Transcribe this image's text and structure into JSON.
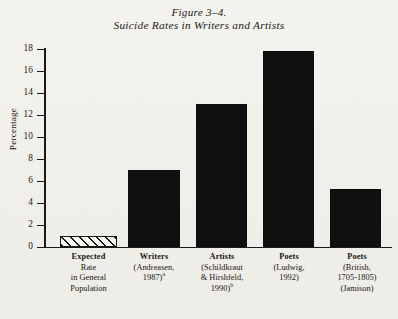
{
  "figure": {
    "title_line1": "Figure 3–4.",
    "title_line2": "Suicide Rates in Writers and Artists"
  },
  "chart_data": {
    "type": "bar",
    "title": "Figure 3–4. Suicide Rates in Writers and Artists",
    "xlabel": "",
    "ylabel": "Percentage",
    "ylim": [
      0,
      18
    ],
    "ytick_step": 2,
    "yticks": [
      0,
      2,
      4,
      6,
      8,
      10,
      12,
      14,
      16,
      18
    ],
    "ytick_labels": [
      "0",
      "2",
      "4",
      "6",
      "8",
      "10",
      "12",
      "14",
      "16",
      "18"
    ],
    "grid": false,
    "legend": "none",
    "categories": [
      "Expected Rate in General Population",
      "Writers (Andreasen, 1987)a",
      "Artists (Schildkraut & Hirshfeld, 1990)b",
      "Poets (Ludwig, 1992)",
      "Poets (British, 1705-1805) (Jamison)"
    ],
    "values": [
      1.0,
      7.0,
      13.0,
      17.8,
      5.3
    ],
    "bar_styles": [
      "hatched",
      "solid",
      "solid",
      "solid",
      "solid"
    ],
    "colors": {
      "bar_fill": "#111010",
      "hatch_line": "#17160f",
      "hatch_bg": "#faf8f3",
      "axis": "#1a1917",
      "background": "#f2f0ea"
    }
  },
  "xlabels": [
    {
      "lead": "Expected",
      "lines": [
        "Rate",
        "in General",
        "Population"
      ],
      "sup": ""
    },
    {
      "lead": "Writers",
      "lines": [
        "(Andreasen,",
        "1987)"
      ],
      "sup": "a"
    },
    {
      "lead": "Artists",
      "lines": [
        "(Schildkraut",
        "& Hirshfeld,",
        "1990)"
      ],
      "sup": "b"
    },
    {
      "lead": "Poets",
      "lines": [
        "(Ludwig,",
        "1992)"
      ],
      "sup": ""
    },
    {
      "lead": "Poets",
      "lines": [
        "(British,",
        "1705-1805)",
        "(Jamison)"
      ],
      "sup": ""
    }
  ]
}
